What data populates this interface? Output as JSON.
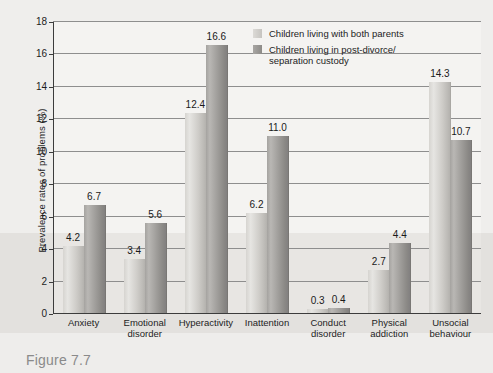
{
  "figure": {
    "caption": "Figure 7.7"
  },
  "chart_data": {
    "type": "bar",
    "title": "",
    "xlabel": "",
    "ylabel": "Prevalence rates of problems (%)",
    "ylim": [
      0,
      18
    ],
    "ytick_step": 2,
    "ytick_labels": [
      "0",
      "2",
      "4",
      "6",
      "8",
      "10",
      "12",
      "14",
      "16",
      "18"
    ],
    "grid": true,
    "legend_position": "top-right",
    "categories": [
      "Anxiety",
      "Emotional disorder",
      "Hyperactivity",
      "Inattention",
      "Conduct disorder",
      "Physical addiction",
      "Unsocial behaviour"
    ],
    "category_lines": [
      [
        "Anxiety"
      ],
      [
        "Emotional",
        "disorder"
      ],
      [
        "Hyperactivity"
      ],
      [
        "Inattention"
      ],
      [
        "Conduct",
        "disorder"
      ],
      [
        "Physical",
        "addiction"
      ],
      [
        "Unsocial",
        "behaviour"
      ]
    ],
    "series": [
      {
        "name": "Children living with both parents",
        "color": "#cfcdc9",
        "values": [
          4.2,
          3.4,
          12.4,
          6.2,
          0.3,
          2.7,
          14.3
        ],
        "labels": [
          "4.2",
          "3.4",
          "12.4",
          "6.2",
          "0.3",
          "2.7",
          "14.3"
        ]
      },
      {
        "name": "Children living in post-divorce/ separation custody",
        "color": "#9d9b98",
        "values": [
          6.7,
          5.6,
          16.6,
          11.0,
          0.4,
          4.4,
          10.7
        ],
        "labels": [
          "6.7",
          "5.6",
          "16.6",
          "11.0",
          "0.4",
          "4.4",
          "10.7"
        ]
      }
    ],
    "legend": [
      {
        "label": "Children living with both parents",
        "swatch": "light"
      },
      {
        "label": "Children living in post-divorce/",
        "label2": "separation custody",
        "swatch": "dark"
      }
    ]
  }
}
